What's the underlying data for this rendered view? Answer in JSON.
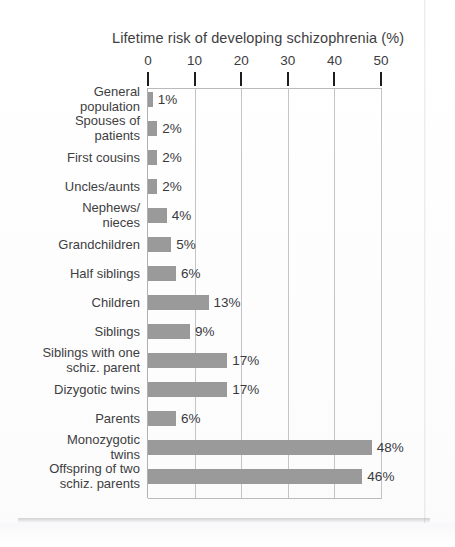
{
  "chart_data": {
    "type": "bar",
    "orientation": "horizontal",
    "title": "Lifetime risk of  developing schizophrenia (%)",
    "xlabel": "",
    "ylabel": "",
    "xlim": [
      0,
      50
    ],
    "xticks": [
      "0",
      "10",
      "20",
      "30",
      "40",
      "50"
    ],
    "grid": true,
    "legend": null,
    "bar_color": "#9a9a9a",
    "categories": [
      "General population",
      "Spouses of patients",
      "First cousins",
      "Uncles/aunts",
      "Nephews/ nieces",
      "Grandchildren",
      "Half siblings",
      "Children",
      "Siblings",
      "Siblings with one schiz. parent",
      "Dizygotic twins",
      "Parents",
      "Monozygotic twins",
      "Offspring of two schiz. parents"
    ],
    "category_lines": [
      [
        "General",
        "population"
      ],
      [
        "Spouses of",
        "patients"
      ],
      [
        "First cousins"
      ],
      [
        "Uncles/aunts"
      ],
      [
        "Nephews/",
        "nieces"
      ],
      [
        "Grandchildren"
      ],
      [
        "Half siblings"
      ],
      [
        "Children"
      ],
      [
        "Siblings"
      ],
      [
        "Siblings with one",
        "schiz. parent"
      ],
      [
        "Dizygotic twins"
      ],
      [
        "Parents"
      ],
      [
        "Monozygotic",
        "twins"
      ],
      [
        "Offspring of two",
        "schiz. parents"
      ]
    ],
    "values": [
      1,
      2,
      2,
      2,
      4,
      5,
      6,
      13,
      9,
      17,
      17,
      6,
      48,
      46
    ],
    "value_labels": [
      "1%",
      "2%",
      "2%",
      "2%",
      "4%",
      "5%",
      "6%",
      "13%",
      "9%",
      "17%",
      "17%",
      "6%",
      "48%",
      "46%"
    ]
  }
}
